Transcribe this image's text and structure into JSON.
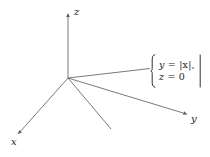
{
  "figure": {
    "kind": "3d-coordinate-axes-diagram",
    "background_color": "#ffffff",
    "line_color": "#6b6b6b",
    "text_color": "#1a1a1a",
    "axis_labels": {
      "z": "z",
      "x": "x",
      "y": "y"
    },
    "system": {
      "left_delimiter": "brace-left",
      "right_delimiter": "vertical-bar",
      "equations": [
        "y = |x|,",
        "z = 0"
      ],
      "equation_1_lhs": "y",
      "equation_1_rhs": "= |x|,",
      "equation_2_lhs": "z",
      "equation_2_rhs": "= 0"
    },
    "origin": {
      "x": 68,
      "y": 78
    },
    "axes": [
      {
        "name": "z-axis",
        "from": [
          68,
          78
        ],
        "to": [
          68,
          12
        ],
        "arrow": true
      },
      {
        "name": "x-axis",
        "from": [
          68,
          78
        ],
        "to": [
          17,
          135
        ],
        "arrow": true
      },
      {
        "name": "y-axis",
        "from": [
          68,
          78
        ],
        "to": [
          188,
          115
        ],
        "arrow": true
      }
    ],
    "graph_rays": [
      {
        "name": "ray-positive-branch",
        "from": [
          68,
          78
        ],
        "to": [
          150,
          69
        ],
        "arrow": false
      },
      {
        "name": "ray-negative-branch",
        "from": [
          68,
          78
        ],
        "to": [
          111,
          129
        ],
        "arrow": false
      }
    ]
  }
}
